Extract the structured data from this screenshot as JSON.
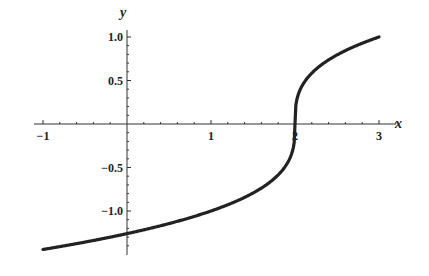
{
  "chart_data": {
    "type": "line",
    "title": "",
    "xlabel": "x",
    "ylabel": "y",
    "function": "y = (x - 2)^(1/3)",
    "xlim": [
      -1,
      3
    ],
    "ylim": [
      -1.44,
      1.0
    ],
    "grid": false,
    "legend": null,
    "x_ticks": [
      -1,
      1,
      2,
      3
    ],
    "x_tick_labels": [
      "−1",
      "1",
      "2",
      "3"
    ],
    "y_ticks": [
      1.0,
      0.5,
      -0.5,
      -1.0
    ],
    "y_tick_labels": [
      "1.0",
      "0.5",
      "−0.5",
      "−1.0"
    ],
    "series": [
      {
        "name": "cube root of (x-2)",
        "x": [
          -1,
          -0.5,
          0,
          0.5,
          1,
          1.5,
          1.75,
          1.9,
          1.97,
          2,
          2.03,
          2.1,
          2.25,
          2.5,
          3
        ],
        "values": [
          -1.442,
          -1.357,
          -1.26,
          -1.145,
          -1.0,
          -0.794,
          -0.63,
          -0.464,
          -0.311,
          0,
          0.311,
          0.464,
          0.63,
          0.794,
          1.0
        ]
      }
    ],
    "line_color": "#222222"
  }
}
